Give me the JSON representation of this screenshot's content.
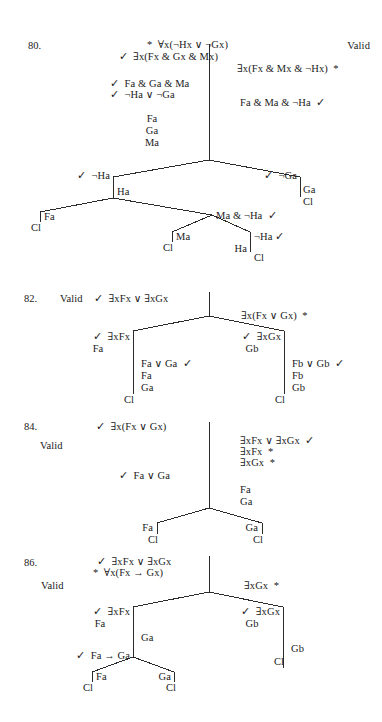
{
  "page": {
    "type": "logic-truth-tree-answer-key",
    "width": 382,
    "height": 722,
    "background": "#ffffff",
    "ink": "#2b2b2b",
    "symbols": {
      "check": "✓",
      "star": "*",
      "forall": "∀",
      "exists": "∃",
      "neg": "¬",
      "or": "∨",
      "and": "&",
      "arrow": "→",
      "closed": "Cl"
    }
  },
  "problems": [
    {
      "number": "80.",
      "verdict": "Valid",
      "nodes": {
        "premise1": "*  ∀x(¬Hx ∨ ¬Gx)",
        "premise2": "✓  ∃x(Fx & Gx & Mx)",
        "negconc": "∃x(Fx & Mx & ¬Hx)  *",
        "inst_a": "✓  Fa & Ga & Ma",
        "inst_b": "✓  ¬Ha ∨ ¬Ga",
        "negconc_inst": "Fa & Ma & ¬Ha  ✓",
        "stack1": "Fa",
        "stack2": "Ga",
        "stack3": "Ma",
        "br_left": "✓  ¬Ha",
        "br_left_child": "Ha",
        "br_right": "✓  ¬Ga",
        "br_right_child": "Ga",
        "br_right_close": "Cl",
        "leaf_fa": "Fa",
        "leaf_fa_close": "Cl",
        "conj_right": "Ma & ¬Ha  ✓",
        "sub_ma": "Ma",
        "sub_ma_close": "Cl",
        "sub_ha": "Ha",
        "sub_negha": "¬Ha ✓",
        "sub_negha_close": "Cl"
      }
    },
    {
      "number": "82.",
      "verdict": "Valid",
      "nodes": {
        "premise1": "✓  ∃xFx ∨ ∃xGx",
        "negconc": "∃x(Fx ∨ Gx)  *",
        "left_head": "✓  ∃xFx",
        "left_inst": "Fa",
        "left_disj": "Fa ∨ Ga  ✓",
        "left_d1": "Fa",
        "left_d2": "Ga",
        "left_close": "Cl",
        "right_head": "✓  ∃xGx",
        "right_inst": "Gb",
        "right_disj": "Fb ∨ Gb  ✓",
        "right_d1": "Fb",
        "right_d2": "Gb",
        "right_close": "Cl"
      }
    },
    {
      "number": "84.",
      "verdict": "Valid",
      "nodes": {
        "premise1": "✓  ∃x(Fx ∨ Gx)",
        "negconc1": "∃xFx ∨ ∃xGx  ✓",
        "negconc2": "∃xFx  *",
        "negconc3": "∃xGx  *",
        "inst_fa": "Fa",
        "inst_ga": "Ga",
        "disj": "✓  Fa ∨ Ga",
        "leaf_left": "Fa",
        "leaf_left_close": "Cl",
        "leaf_right": "Ga",
        "leaf_right_close": "Cl"
      }
    },
    {
      "number": "86.",
      "verdict": "Valid",
      "nodes": {
        "premise1": "✓  ∃xFx ∨ ∃xGx",
        "premise2": "*  ∀x(Fx → Gx)",
        "negconc": "∃xGx  *",
        "left_head": "✓  ∃xFx",
        "left_inst": "Fa",
        "left_ga": "Ga",
        "left_cond": "✓  Fa → Ga",
        "leaf_fa": "Fa",
        "leaf_fa_close": "Cl",
        "leaf_ga": "Ga",
        "leaf_ga_close": "Cl",
        "right_head": "✓  ∃xGx",
        "right_inst": "Gb",
        "right_gb": "Gb",
        "right_close": "Cl"
      }
    }
  ]
}
